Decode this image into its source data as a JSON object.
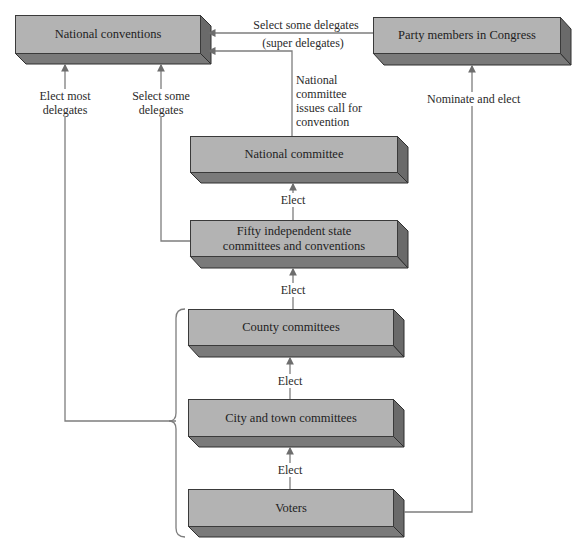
{
  "diagram": {
    "boxes": {
      "national_conventions": "National conventions",
      "party_members_congress": "Party members in Congress",
      "national_committee": "National committee",
      "state_committees": "Fifty independent state committees and conventions",
      "state_committees_line1": "Fifty independent state",
      "state_committees_line2": "committees and conventions",
      "county_committees": "County committees",
      "city_town_committees": "City and town committees",
      "voters": "Voters"
    },
    "edge_labels": {
      "select_some_delegates_top": "Select some delegates",
      "super_delegates": "(super delegates)",
      "elect_most_line1": "Elect most",
      "elect_most_line2": "delegates",
      "select_some_line1": "Select some",
      "select_some_line2": "delegates",
      "call_line1": "National",
      "call_line2": "committee",
      "call_line3": "issues call for",
      "call_line4": "convention",
      "nominate_and_elect": "Nominate and elect",
      "elect_1": "Elect",
      "elect_2": "Elect",
      "elect_3": "Elect",
      "elect_4": "Elect"
    },
    "colors": {
      "box_front": "#b3b3b3",
      "box_bottom": "#7a7a7a",
      "box_side": "#6a6a6a",
      "line": "#7d7d7d"
    }
  }
}
